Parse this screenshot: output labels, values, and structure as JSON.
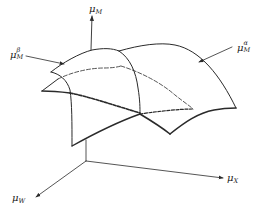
{
  "figure": {
    "colors": {
      "line": "#2a2a2a",
      "background": "#ffffff"
    },
    "axes": {
      "vertical": {
        "symbol": "μ",
        "subscript": "M"
      },
      "x": {
        "symbol": "μ",
        "subscript": "X"
      },
      "w": {
        "symbol": "μ",
        "subscript": "W"
      }
    },
    "surfaces": {
      "beta": {
        "symbol": "μ",
        "subscript": "M",
        "superscript": "β"
      },
      "alpha": {
        "symbol": "μ",
        "subscript": "M",
        "superscript": "α"
      }
    }
  }
}
